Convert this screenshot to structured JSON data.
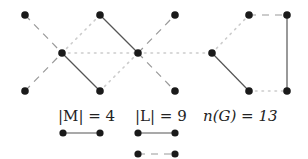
{
  "graph": {
    "nodes": [
      {
        "id": "a",
        "x": 25,
        "y": 15
      },
      {
        "id": "b",
        "x": 62,
        "y": 53
      },
      {
        "id": "c",
        "x": 25,
        "y": 91
      },
      {
        "id": "d",
        "x": 100,
        "y": 15
      },
      {
        "id": "e",
        "x": 100,
        "y": 91
      },
      {
        "id": "f",
        "x": 138,
        "y": 53
      },
      {
        "id": "g",
        "x": 175,
        "y": 15
      },
      {
        "id": "h",
        "x": 175,
        "y": 91
      },
      {
        "id": "i",
        "x": 212,
        "y": 53
      },
      {
        "id": "j",
        "x": 249,
        "y": 15
      },
      {
        "id": "k",
        "x": 287,
        "y": 15
      },
      {
        "id": "l",
        "x": 249,
        "y": 91
      },
      {
        "id": "m",
        "x": 287,
        "y": 91
      }
    ],
    "edges": [
      {
        "from": "a",
        "to": "b",
        "style": "dashed"
      },
      {
        "from": "c",
        "to": "b",
        "style": "dashed"
      },
      {
        "from": "b",
        "to": "e",
        "style": "solid"
      },
      {
        "from": "b",
        "to": "d",
        "style": "dotted"
      },
      {
        "from": "b",
        "to": "f",
        "style": "dotted"
      },
      {
        "from": "d",
        "to": "f",
        "style": "solid"
      },
      {
        "from": "e",
        "to": "f",
        "style": "dotted"
      },
      {
        "from": "f",
        "to": "g",
        "style": "dashed"
      },
      {
        "from": "f",
        "to": "h",
        "style": "dashed"
      },
      {
        "from": "f",
        "to": "i",
        "style": "dotted"
      },
      {
        "from": "i",
        "to": "j",
        "style": "dotted"
      },
      {
        "from": "i",
        "to": "l",
        "style": "solid"
      },
      {
        "from": "j",
        "to": "k",
        "style": "dashed"
      },
      {
        "from": "k",
        "to": "m",
        "style": "solid"
      },
      {
        "from": "l",
        "to": "m",
        "style": "dotted"
      }
    ]
  },
  "legend": {
    "matching": {
      "label": "|M| = 4"
    },
    "linear_forest": {
      "label": "|L| = 9"
    },
    "order": {
      "label": "n(G) = 13"
    }
  },
  "colors": {
    "node": "#1a1a1a",
    "solid": "#555555",
    "dashed": "#999999",
    "dotted": "#cccccc"
  }
}
